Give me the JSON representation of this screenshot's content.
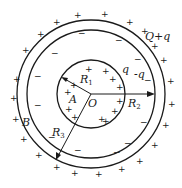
{
  "diagram": {
    "type": "concentric-spheres-electrostatics",
    "center_label": "O",
    "inner_sphere": {
      "radius_label": "R",
      "radius_sub": "1",
      "charge_label": "q",
      "region_label": "A"
    },
    "shell_inner_surface": {
      "radius_label": "R",
      "radius_sub": "2",
      "charge_label": "-q"
    },
    "shell_outer_surface": {
      "radius_label": "R",
      "radius_sub": "3",
      "charge_label": "Q+q"
    },
    "shell_region_label": "B",
    "signs": {
      "positive": "+",
      "negative": "−"
    },
    "colors": {
      "stroke": "#1a1a1a",
      "background": "#ffffff"
    }
  }
}
